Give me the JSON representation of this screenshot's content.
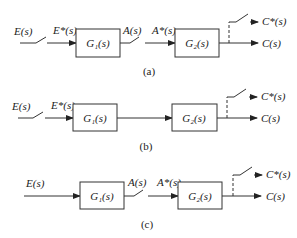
{
  "diagrams": [
    {
      "caption": "(a)",
      "input_label": "E(s)",
      "sampled_input_label": "E*(s)",
      "block1": "G₁(s)",
      "mid_label": "A(s)",
      "sampled_mid_label": "A*(s)",
      "block2": "G₂(s)",
      "sampled_output_label": "C*(s)",
      "output_label": "C(s)",
      "input_sampler": true,
      "mid_sampler": true
    },
    {
      "caption": "(b)",
      "input_label": "E(s)",
      "sampled_input_label": "E*(s)",
      "block1": "G₁(s)",
      "block2": "G₂(s)",
      "sampled_output_label": "C*(s)",
      "output_label": "C(s)",
      "input_sampler": true,
      "mid_sampler": false
    },
    {
      "caption": "(c)",
      "input_label": "E(s)",
      "block1": "G₁(s)",
      "mid_label": "A(s)",
      "sampled_mid_label": "A*(s)",
      "block2": "G₂(s)",
      "sampled_output_label": "C*(s)",
      "output_label": "C(s)",
      "input_sampler": false,
      "mid_sampler": true
    }
  ]
}
